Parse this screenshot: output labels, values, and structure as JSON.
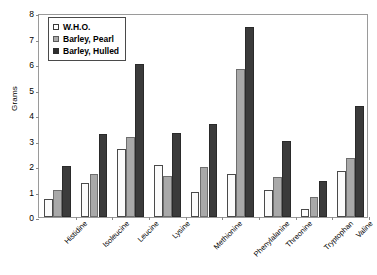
{
  "chart_data": {
    "type": "bar",
    "title": "",
    "xlabel": "",
    "ylabel": "Grams",
    "ylim": [
      0,
      8
    ],
    "ytick_step": 1,
    "yticks": [
      "8",
      "7",
      "6",
      "5",
      "4",
      "3",
      "2",
      "1",
      "0"
    ],
    "grid": false,
    "legend_position": "top-left",
    "categories": [
      "Histidine",
      "Isoleucine",
      "Leucine",
      "Lysine",
      "Methionine",
      "Phenylalanine",
      "Threonine",
      "Tryptophan",
      "Valine"
    ],
    "series": [
      {
        "name": "W.H.O.",
        "color": "#ffffff",
        "values": [
          0.7,
          1.35,
          2.65,
          2.05,
          1.0,
          1.7,
          1.05,
          0.3,
          1.8
        ]
      },
      {
        "name": "Barley, Pearl",
        "color": "#a9a9a9",
        "values": [
          1.05,
          1.7,
          3.15,
          1.6,
          1.95,
          5.8,
          1.55,
          0.8,
          2.3
        ]
      },
      {
        "name": "Barley, Hulled",
        "color": "#3b3b3b",
        "values": [
          2.0,
          3.25,
          6.0,
          3.3,
          3.65,
          7.45,
          3.0,
          1.4,
          4.35
        ]
      }
    ]
  }
}
